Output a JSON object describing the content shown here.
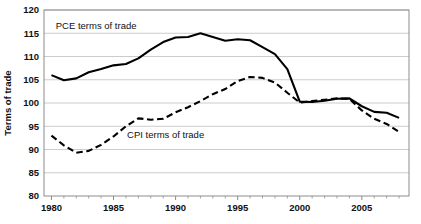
{
  "chart_data": {
    "type": "line",
    "title": "",
    "xlabel": "",
    "ylabel": "Terms of trade",
    "xlim": [
      1979.4,
      2008.8
    ],
    "ylim": [
      80,
      120
    ],
    "ytick_step": 5,
    "yticks": [
      80,
      85,
      90,
      95,
      100,
      105,
      110,
      115,
      120
    ],
    "ytick_labels": [
      "80",
      "85",
      "90",
      "95",
      "100",
      "105",
      "110",
      "115",
      "120"
    ],
    "xticks": [
      1980,
      1985,
      1990,
      1995,
      2000,
      2005
    ],
    "xtick_labels": [
      "1980",
      "1985",
      "1990",
      "1995",
      "2000",
      "2005"
    ],
    "xtick_minor_step": 1,
    "grid": "horizontal",
    "grid_color": "#BFBFBF",
    "plot_border_color": "#808080",
    "legend": "inline-annotations",
    "x": [
      1980,
      1981,
      1982,
      1983,
      1984,
      1985,
      1986,
      1987,
      1988,
      1989,
      1990,
      1991,
      1992,
      1993,
      1994,
      1995,
      1996,
      1997,
      1998,
      1999,
      2000,
      2001,
      2002,
      2003,
      2004,
      2005,
      2006,
      2007,
      2008
    ],
    "series": [
      {
        "name": "PCE terms of trade",
        "style": "solid",
        "color": "#000000",
        "width": 2.1,
        "annotation": {
          "text": "PCE terms of trade",
          "x": 1983.6,
          "y": 116.6
        },
        "values": [
          106.0,
          104.9,
          105.3,
          106.6,
          107.3,
          108.1,
          108.4,
          109.6,
          111.5,
          113.1,
          114.1,
          114.2,
          115.0,
          114.2,
          113.4,
          113.7,
          113.5,
          112.0,
          110.5,
          107.3,
          100.3,
          100.2,
          100.5,
          100.9,
          101.0,
          99.3,
          98.1,
          97.9,
          96.8
        ]
      },
      {
        "name": "CPI terms of trade",
        "style": "dashed",
        "color": "#000000",
        "width": 2.1,
        "annotation": {
          "text": "CPI terms of trade",
          "x": 1989.2,
          "y": 93.2
        },
        "values": [
          93.0,
          90.9,
          89.3,
          89.7,
          91.0,
          92.8,
          95.0,
          96.7,
          96.4,
          96.6,
          98.0,
          99.1,
          100.4,
          101.9,
          103.0,
          104.7,
          105.6,
          105.4,
          104.4,
          102.2,
          100.1,
          100.4,
          100.7,
          101.0,
          100.9,
          98.4,
          96.6,
          95.5,
          93.8
        ]
      }
    ]
  },
  "axis": {
    "y_title": "Terms of trade"
  }
}
